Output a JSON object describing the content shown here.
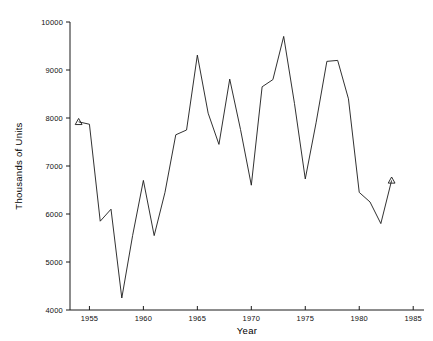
{
  "chart_data": {
    "type": "line",
    "title": "",
    "xlabel": "Year",
    "ylabel": "Thousands of Units",
    "xlim": [
      1953.2,
      1986.0
    ],
    "ylim": [
      4000,
      10000
    ],
    "xticks": [
      1955,
      1960,
      1965,
      1970,
      1975,
      1980,
      1985
    ],
    "xtick_labels": [
      "1955",
      "1960",
      "1965",
      "1970",
      "1975",
      "1980",
      "1985"
    ],
    "yticks": [
      4000,
      5000,
      6000,
      7000,
      8000,
      9000,
      10000
    ],
    "ytick_labels": [
      "4000",
      "5000",
      "6000",
      "7000",
      "8000",
      "9000",
      "10000"
    ],
    "grid": false,
    "legend": null,
    "line_color": "#1a1a1a",
    "marker": "triangle-up",
    "marker_points": [
      1954,
      1983
    ],
    "x": [
      1954,
      1955,
      1956,
      1957,
      1958,
      1959,
      1960,
      1961,
      1962,
      1963,
      1964,
      1965,
      1966,
      1967,
      1968,
      1969,
      1970,
      1971,
      1972,
      1973,
      1974,
      1975,
      1976,
      1977,
      1978,
      1979,
      1980,
      1981,
      1982,
      1983
    ],
    "values": [
      7920,
      7870,
      5850,
      6100,
      4250,
      5550,
      6700,
      5550,
      6450,
      7650,
      7750,
      9310,
      8100,
      7450,
      8810,
      7760,
      6600,
      8650,
      8800,
      9700,
      8300,
      6730,
      7900,
      9180,
      9200,
      8400,
      6450,
      6250,
      5800,
      6700
    ]
  },
  "axis": {
    "x_title": "Year",
    "y_title": "Thousands of Units"
  }
}
